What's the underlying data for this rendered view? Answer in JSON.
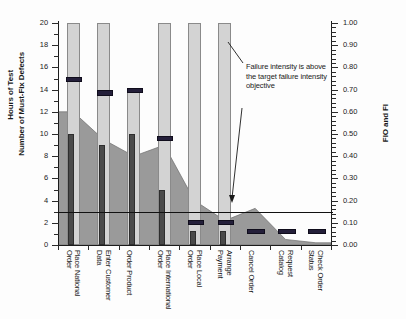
{
  "chart_data": {
    "type": "bar",
    "title": "",
    "subtitle": "",
    "xlabel": "",
    "ylabel": "Hours of Test / Number of Must-Fix Defects",
    "y2label": "FIO and FI",
    "ylim": [
      0,
      20
    ],
    "y2lim": [
      0.0,
      1.0
    ],
    "grid": false,
    "legend_position": "none",
    "categories": [
      "Place National Order",
      "Enter Customer Data",
      "Order Product",
      "Place International Order",
      "Place Local Order",
      "Arrange Payment",
      "Cancel Order",
      "Request Catalog",
      "Check Order Status"
    ],
    "series": [
      {
        "name": "Hours of Test",
        "type": "bar",
        "color": "#d3d3d3",
        "axis": "left",
        "values": [
          20,
          20,
          14,
          20,
          20,
          20,
          0,
          0,
          0
        ]
      },
      {
        "name": "Number of Must-Fix Defects",
        "type": "bar",
        "color": "#4a4a4a",
        "axis": "left",
        "values": [
          10,
          9,
          10,
          5,
          1.3,
          1.3,
          0,
          0,
          0
        ]
      },
      {
        "name": "FI",
        "type": "marker",
        "color": "#241f3a",
        "axis": "right",
        "values": [
          0.75,
          0.69,
          0.7,
          0.485,
          0.105,
          0.105,
          0.065,
          0.065,
          0.065
        ]
      },
      {
        "name": "FIO",
        "type": "area",
        "color": "#9a9a9a",
        "axis": "left",
        "values": [
          12,
          9.5,
          8,
          9,
          4,
          2.2,
          3.3,
          0.5,
          0.2
        ]
      }
    ],
    "threshold": {
      "label": "target failure intensity objective",
      "value_left": 3.0,
      "value_right": 0.15,
      "color": "#111111"
    },
    "yticks": [
      "20",
      "18",
      "16",
      "14",
      "12",
      "10",
      "8",
      "6",
      "4",
      "2",
      "0"
    ],
    "y2ticks": [
      "1.00",
      "0.90",
      "0.80",
      "0.70",
      "0.60",
      "0.50",
      "0.40",
      "0.30",
      "0.20",
      "0.10",
      "0.00"
    ],
    "annotation": {
      "text": "Failure intensity is above the target failure intensity objective"
    }
  },
  "axes": {
    "left_title_line1": "Hours of Test",
    "left_title_line2": "Number of Must-Fix Defects",
    "right_title": "FIO and FI"
  }
}
